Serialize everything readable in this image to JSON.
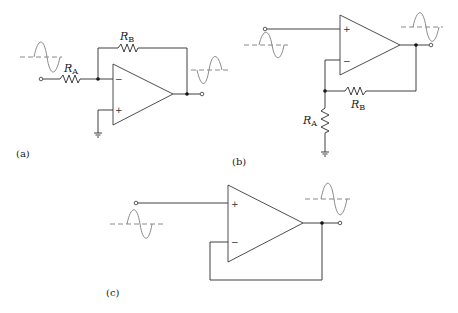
{
  "figure": {
    "panels": [
      {
        "id": "a",
        "caption": "(a)",
        "type": "inverting amplifier",
        "components": {
          "input_resistor": {
            "label": "R",
            "subscript": "A"
          },
          "feedback_resistor": {
            "label": "R",
            "subscript": "B"
          }
        },
        "inputs": {
          "plus": "+",
          "minus": "−"
        },
        "input_waveform": "sine",
        "output_waveform": "inverted sine"
      },
      {
        "id": "b",
        "caption": "(b)",
        "type": "non-inverting amplifier",
        "components": {
          "ground_resistor": {
            "label": "R",
            "subscript": "A"
          },
          "feedback_resistor": {
            "label": "R",
            "subscript": "B"
          }
        },
        "inputs": {
          "plus": "+",
          "minus": "−"
        },
        "input_waveform": "sine",
        "output_waveform": "amplified sine"
      },
      {
        "id": "c",
        "caption": "(c)",
        "type": "voltage follower",
        "components": {},
        "inputs": {
          "plus": "+",
          "minus": "−"
        },
        "input_waveform": "sine",
        "output_waveform": "sine"
      }
    ]
  },
  "colors": {
    "wire": "#2a2a2a",
    "waveform": "#8a8a8a",
    "background": "#ffffff"
  }
}
